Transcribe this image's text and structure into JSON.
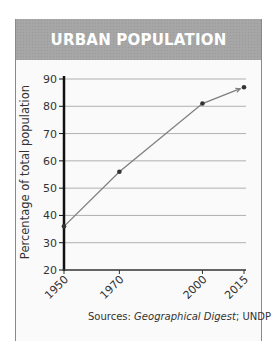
{
  "header": {
    "title": "URBAN POPULATION"
  },
  "source": {
    "prefix": "Sources: ",
    "italic": "Geographical Digest",
    "suffix": "; UNDP"
  },
  "colors": {
    "header_bg": "#a6a6a6",
    "line": "#808080",
    "point": "#333333",
    "axis": "#111111",
    "grid": "#b0b0b0"
  },
  "chart_data": {
    "type": "line",
    "title": "URBAN POPULATION",
    "xlabel": "",
    "ylabel": "Percentage of total population",
    "x": [
      1950,
      1970,
      2000,
      2015
    ],
    "series": [
      {
        "name": "Urban population",
        "values": [
          36,
          56,
          81,
          87
        ]
      }
    ],
    "ylim": [
      20,
      90
    ],
    "yticks": [
      20,
      30,
      40,
      50,
      60,
      70,
      80,
      90
    ],
    "xticks": [
      "1950",
      "1970",
      "2000",
      "2015"
    ],
    "grid": true,
    "annotations": [
      "Sources: Geographical Digest; UNDP"
    ],
    "legend": "none"
  }
}
